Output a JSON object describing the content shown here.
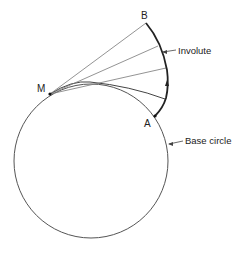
{
  "diagram": {
    "points": {
      "B": "B",
      "M": "M",
      "A": "A"
    },
    "labels": {
      "involute": "Involute",
      "base_circle": "Base circle"
    },
    "colors": {
      "stroke": "#333333",
      "thin_line": "#777777",
      "background": "#ffffff"
    }
  }
}
